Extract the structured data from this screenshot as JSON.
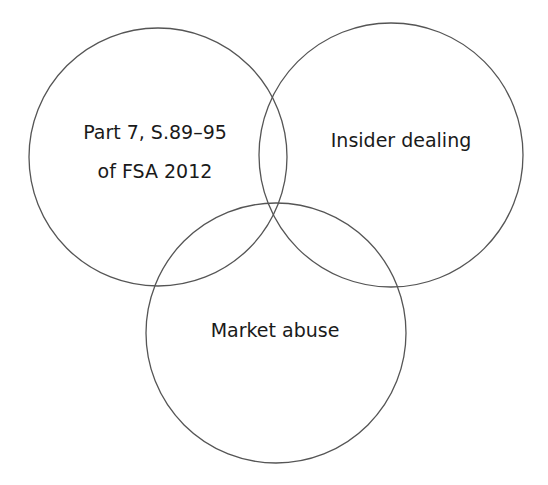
{
  "diagram": {
    "type": "venn",
    "stroke_color": "#555555",
    "background": "#ffffff",
    "circles": [
      {
        "id": "left",
        "label_line1": "Part 7, S.89–95",
        "label_line2": "of FSA 2012",
        "cx": 158,
        "cy": 157,
        "r": 129
      },
      {
        "id": "right",
        "label": "Insider dealing",
        "cx": 391,
        "cy": 155,
        "r": 132
      },
      {
        "id": "bottom",
        "label": "Market abuse",
        "cx": 276,
        "cy": 333,
        "r": 130
      }
    ]
  }
}
